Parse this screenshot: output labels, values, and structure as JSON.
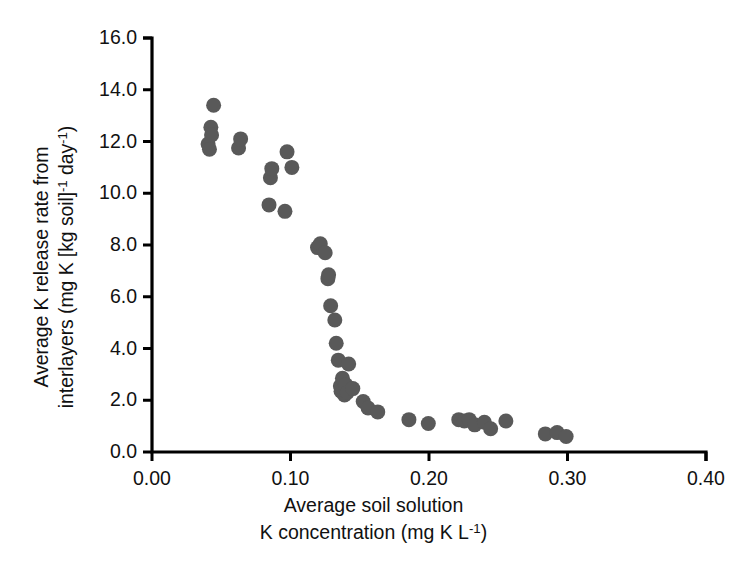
{
  "chart_data": {
    "type": "scatter",
    "title": "",
    "xlabel": "Average soil solution K concentration (mg K L-1)",
    "xlabel_lines": [
      "Average soil solution",
      "K concentration (mg K L"
    ],
    "ylabel": "Average K release rate from interlayers (mg K [kg soil]-1 day-1)",
    "ylabel_lines": [
      "Average K release rate from",
      "interlayers (mg K [kg soil]"
    ],
    "xlim": [
      0.0,
      0.4
    ],
    "ylim": [
      0.0,
      16.0
    ],
    "xticks": [
      0.0,
      0.1,
      0.2,
      0.3,
      0.4
    ],
    "xtick_labels": [
      "0.00",
      "0.10",
      "0.20",
      "0.30",
      "0.40"
    ],
    "yticks": [
      0.0,
      2.0,
      4.0,
      6.0,
      8.0,
      10.0,
      12.0,
      14.0,
      16.0
    ],
    "ytick_labels": [
      "0.0",
      "2.0",
      "4.0",
      "6.0",
      "8.0",
      "10.0",
      "12.0",
      "14.0",
      "16.0"
    ],
    "grid": false,
    "legend": null,
    "marker": {
      "shape": "circle",
      "color": "#595959",
      "size_px": 15,
      "edge": "none"
    },
    "axis_color": "#000000",
    "series": [
      {
        "name": "K release rate vs soil solution K",
        "points": [
          [
            0.0405,
            11.9
          ],
          [
            0.0415,
            11.7
          ],
          [
            0.0425,
            12.55
          ],
          [
            0.043,
            12.25
          ],
          [
            0.0445,
            13.4
          ],
          [
            0.0625,
            11.75
          ],
          [
            0.064,
            12.1
          ],
          [
            0.0845,
            9.55
          ],
          [
            0.0855,
            10.6
          ],
          [
            0.0865,
            10.95
          ],
          [
            0.096,
            9.3
          ],
          [
            0.0975,
            11.6
          ],
          [
            0.101,
            11.0
          ],
          [
            0.1195,
            7.9
          ],
          [
            0.1215,
            8.05
          ],
          [
            0.125,
            7.7
          ],
          [
            0.127,
            6.7
          ],
          [
            0.1275,
            6.85
          ],
          [
            0.129,
            5.65
          ],
          [
            0.132,
            5.1
          ],
          [
            0.133,
            4.2
          ],
          [
            0.1345,
            3.55
          ],
          [
            0.136,
            2.55
          ],
          [
            0.1365,
            2.35
          ],
          [
            0.1375,
            2.85
          ],
          [
            0.139,
            2.2
          ],
          [
            0.14,
            2.6
          ],
          [
            0.141,
            2.3
          ],
          [
            0.142,
            3.4
          ],
          [
            0.145,
            2.45
          ],
          [
            0.1525,
            1.95
          ],
          [
            0.156,
            1.7
          ],
          [
            0.163,
            1.55
          ],
          [
            0.1855,
            1.25
          ],
          [
            0.1995,
            1.1
          ],
          [
            0.2215,
            1.25
          ],
          [
            0.2255,
            1.2
          ],
          [
            0.229,
            1.25
          ],
          [
            0.233,
            1.05
          ],
          [
            0.24,
            1.15
          ],
          [
            0.2445,
            0.9
          ],
          [
            0.2555,
            1.2
          ],
          [
            0.284,
            0.7
          ],
          [
            0.2925,
            0.75
          ],
          [
            0.299,
            0.6
          ]
        ]
      }
    ]
  },
  "axes_geometry": {
    "left_px": 152,
    "right_px": 706,
    "bottom_px": 452,
    "top_px": 38
  }
}
